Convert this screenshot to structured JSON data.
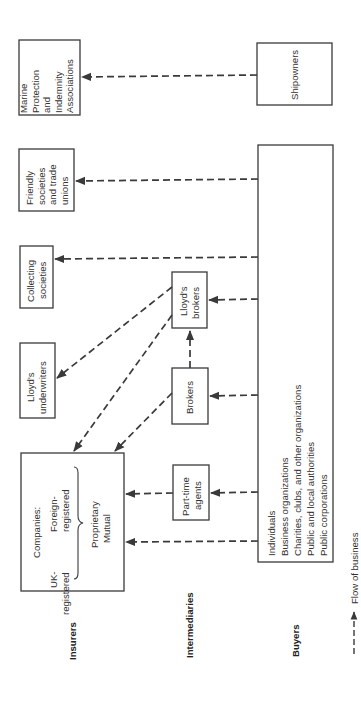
{
  "lanes": {
    "insurers": "Insurers",
    "intermediaries": "Intermediaries",
    "buyers": "Buyers"
  },
  "insurers": {
    "companies": {
      "title": "Companies:",
      "uk_line1": "UK-",
      "uk_line2": "registered",
      "foreign_line1": "Foreign-",
      "foreign_line2": "registered",
      "type_line1": "Proprietary",
      "type_line2": "Mutual"
    },
    "lloyds_underwriters": [
      "Lloyd's",
      "underwriters"
    ],
    "collecting_societies": [
      "Collecting",
      "societies"
    ],
    "friendly_societies": [
      "Friendly",
      "societies",
      "and trade",
      "unions"
    ],
    "marine_pi": [
      "Marine",
      "Protection",
      "and",
      "Indemnity",
      "Associations"
    ]
  },
  "intermediaries": {
    "part_time_agents": [
      "Part-time",
      "agents"
    ],
    "brokers": [
      "Brokers"
    ],
    "lloyds_brokers": [
      "Lloyd's",
      "brokers"
    ]
  },
  "buyers": {
    "general": [
      "Individuals",
      "Business organizations",
      "Charities, clubs, and other organizations",
      "Public and local authorities",
      "Public corporations"
    ],
    "shipowners": [
      "Shipowners"
    ]
  },
  "legend": {
    "label": "Flow of business",
    "icon": "dashed-arrow-icon"
  },
  "colors": {
    "line": "#3a3a3a",
    "background": "#ffffff"
  }
}
